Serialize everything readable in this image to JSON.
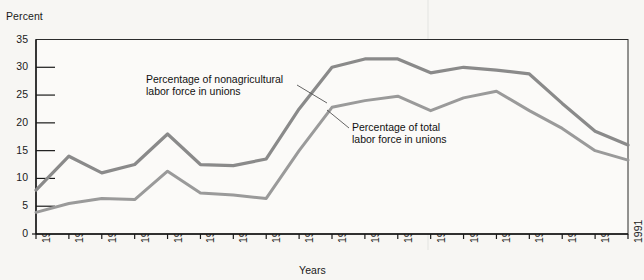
{
  "chart_data": {
    "type": "line",
    "title": "",
    "xlabel": "Years",
    "ylabel": "Percent",
    "ylim": [
      0,
      35
    ],
    "ytick_step": 5,
    "yticks": [
      "0",
      "5",
      "10",
      "15",
      "20",
      "25",
      "30",
      "35"
    ],
    "grid": false,
    "legend": "annotations",
    "categories": [
      "1900",
      "1905",
      "1910",
      "1915",
      "1920",
      "1925",
      "1930",
      "1935",
      "1940",
      "1945",
      "1950",
      "1955",
      "1960",
      "1965",
      "1970",
      "1975",
      "1980",
      "1985",
      "1991"
    ],
    "series": [
      {
        "name": "Percentage of nonagricultural labor force in unions",
        "color": "#8a8a8a",
        "values": [
          7.9,
          14.0,
          11.0,
          12.5,
          18.0,
          12.5,
          12.3,
          13.5,
          22.5,
          30.0,
          31.5,
          31.5,
          29.0,
          30.0,
          29.5,
          28.8,
          23.5,
          18.5,
          16.0
        ]
      },
      {
        "name": "Percentage of total labor force in unions",
        "color": "#9a9a9a",
        "values": [
          3.9,
          5.5,
          6.4,
          6.2,
          11.3,
          7.4,
          7.0,
          6.4,
          15.0,
          22.8,
          24.0,
          24.8,
          22.2,
          24.5,
          25.7,
          22.2,
          19.0,
          15.0,
          13.3
        ]
      }
    ],
    "annotations": [
      {
        "id": "nonag",
        "text": "Percentage of nonagricultural\nlabor force in unions"
      },
      {
        "id": "total",
        "text": "Percentage of total\nlabor force in unions"
      }
    ]
  },
  "axes": {
    "y_title": "Percent",
    "x_title": "Years"
  },
  "colors": {
    "background": "#f7f6f3",
    "axis": "#1a1a1a",
    "series_nonag": "#8a8a8a",
    "series_total": "#9a9a9a"
  }
}
